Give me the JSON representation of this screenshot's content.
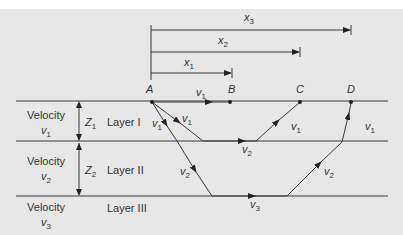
{
  "distances": [
    {
      "symbol": "x",
      "sub": "1"
    },
    {
      "symbol": "x",
      "sub": "2"
    },
    {
      "symbol": "x",
      "sub": "3"
    }
  ],
  "points": [
    "A",
    "B",
    "C",
    "D"
  ],
  "layers": [
    {
      "velocity_label": "Velocity",
      "v_symbol": "v",
      "v_sub": "1",
      "thickness_symbol": "Z",
      "thickness_sub": "1",
      "name": "Layer I"
    },
    {
      "velocity_label": "Velocity",
      "v_symbol": "v",
      "v_sub": "2",
      "thickness_symbol": "Z",
      "thickness_sub": "2",
      "name": "Layer II"
    },
    {
      "velocity_label": "Velocity",
      "v_symbol": "v",
      "v_sub": "3",
      "name": "Layer III"
    }
  ],
  "ray_labels": {
    "direct": {
      "symbol": "v",
      "sub": "1"
    },
    "ray1_down": {
      "symbol": "v",
      "sub": "1"
    },
    "ray1_refract": {
      "symbol": "v",
      "sub": "2"
    },
    "ray1_up": {
      "symbol": "v",
      "sub": "1"
    },
    "ray2_down1": {
      "symbol": "v",
      "sub": "1"
    },
    "ray2_down2": {
      "symbol": "v",
      "sub": "2"
    },
    "ray2_refract": {
      "symbol": "v",
      "sub": "3"
    },
    "ray2_up2": {
      "symbol": "v",
      "sub": "2"
    },
    "ray2_up1": {
      "symbol": "v",
      "sub": "1"
    }
  },
  "colors": {
    "background": "#e7e7e7",
    "line": "#3a3a3a",
    "text": "#333333"
  }
}
